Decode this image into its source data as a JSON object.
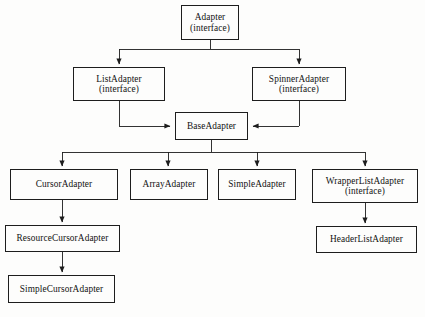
{
  "diagram": {
    "type": "uml-class-hierarchy",
    "background_color": "#fdfdfc",
    "line_color": "#1d1d1d",
    "text_color": "#121212",
    "stereotype_label": "(interface)",
    "nodes": [
      {
        "id": "adapter",
        "name": "Adapter",
        "stereotype": "(interface)",
        "x": 181,
        "y": 5,
        "w": 58,
        "h": 35
      },
      {
        "id": "list_adapter",
        "name": "ListAdapter",
        "stereotype": "(interface)",
        "x": 73,
        "y": 67,
        "w": 92,
        "h": 34
      },
      {
        "id": "spinner_adapter",
        "name": "SpinnerAdapter",
        "stereotype": "(interface)",
        "x": 252,
        "y": 67,
        "w": 94,
        "h": 34
      },
      {
        "id": "base_adapter",
        "name": "BaseAdapter",
        "stereotype": "",
        "x": 175,
        "y": 112,
        "w": 73,
        "h": 28
      },
      {
        "id": "cursor_adapter",
        "name": "CursorAdapter",
        "stereotype": "",
        "x": 10,
        "y": 169,
        "w": 108,
        "h": 31
      },
      {
        "id": "array_adapter",
        "name": "ArrayAdapter",
        "stereotype": "",
        "x": 130,
        "y": 169,
        "w": 78,
        "h": 31
      },
      {
        "id": "simple_adapter",
        "name": "SimpleAdapter",
        "stereotype": "",
        "x": 218,
        "y": 169,
        "w": 78,
        "h": 31
      },
      {
        "id": "wrapper_list_adapter",
        "name": "WrapperListAdapter",
        "stereotype": "(interface)",
        "x": 312,
        "y": 169,
        "w": 106,
        "h": 34
      },
      {
        "id": "resource_cursor",
        "name": "ResourceCursorAdapter",
        "stereotype": "",
        "x": 5,
        "y": 225,
        "w": 115,
        "h": 27
      },
      {
        "id": "header_list_adapter",
        "name": "HeaderListAdapter",
        "stereotype": "",
        "x": 316,
        "y": 226,
        "w": 101,
        "h": 27
      },
      {
        "id": "simple_cursor",
        "name": "SimpleCursorAdapter",
        "stereotype": "",
        "x": 8,
        "y": 275,
        "w": 107,
        "h": 28
      }
    ],
    "edges": [
      {
        "from": "adapter",
        "to": "list_adapter",
        "style": "orthogonal-bus"
      },
      {
        "from": "adapter",
        "to": "spinner_adapter",
        "style": "orthogonal-bus"
      },
      {
        "from": "list_adapter",
        "to": "base_adapter",
        "style": "orthogonal-side"
      },
      {
        "from": "spinner_adapter",
        "to": "base_adapter",
        "style": "orthogonal-side"
      },
      {
        "from": "base_adapter",
        "to": "cursor_adapter",
        "style": "orthogonal-bus"
      },
      {
        "from": "base_adapter",
        "to": "array_adapter",
        "style": "orthogonal-bus"
      },
      {
        "from": "base_adapter",
        "to": "simple_adapter",
        "style": "orthogonal-bus"
      },
      {
        "from": "base_adapter",
        "to": "wrapper_list_adapter",
        "style": "orthogonal-bus"
      },
      {
        "from": "cursor_adapter",
        "to": "resource_cursor",
        "style": "straight"
      },
      {
        "from": "resource_cursor",
        "to": "simple_cursor",
        "style": "straight"
      },
      {
        "from": "wrapper_list_adapter",
        "to": "header_list_adapter",
        "style": "straight"
      }
    ]
  }
}
